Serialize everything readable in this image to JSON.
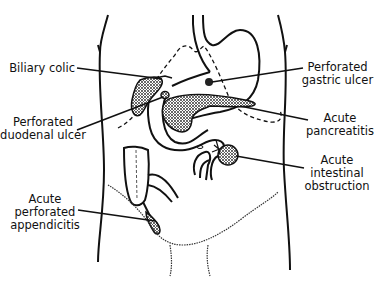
{
  "diagram": {
    "labels": [
      {
        "id": "biliary-colic",
        "lines": [
          "Biliary colic"
        ]
      },
      {
        "id": "perforated-duodenal-ulcer",
        "lines": [
          "Perforated",
          "duodenal ulcer"
        ]
      },
      {
        "id": "perforated-gastric-ulcer",
        "lines": [
          "Perforated",
          "gastric ulcer"
        ]
      },
      {
        "id": "acute-pancreatitis",
        "lines": [
          "Acute",
          "pancreatitis"
        ]
      },
      {
        "id": "acute-intestinal-obstruction",
        "lines": [
          "Acute",
          "intestinal",
          "obstruction"
        ]
      },
      {
        "id": "acute-perforated-appendicitis",
        "lines": [
          "Acute",
          "perforated",
          "appendicitis"
        ]
      }
    ],
    "colors": {
      "ink": "#111111",
      "background": "#ffffff",
      "shade": "#9a9a9a"
    }
  }
}
